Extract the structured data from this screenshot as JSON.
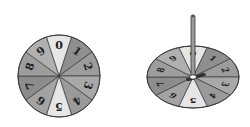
{
  "figure": {
    "left_spinner": {
      "label": "Flat spinner (top view)",
      "sections": [
        "0",
        "1",
        "2",
        "3",
        "4",
        "5",
        "6",
        "7",
        "8",
        "9"
      ],
      "shades": [
        "#e6e6e6",
        "#8f8f8f",
        "#9c9c9c",
        "#a8a8a8",
        "#9a9a9a",
        "#e6e6e6",
        "#a3a3a3",
        "#8c8c8c",
        "#9d9d9d",
        "#b0b0b0"
      ]
    },
    "right_spinner": {
      "label": "Spinner in perspective with pointer",
      "sections": [
        "0",
        "1",
        "2",
        "3",
        "4",
        "5",
        "6",
        "7",
        "8",
        "9"
      ],
      "shades": [
        "#e6e6e6",
        "#8f8f8f",
        "#9c9c9c",
        "#a8a8a8",
        "#9a9a9a",
        "#e6e6e6",
        "#a3a3a3",
        "#8c8c8c",
        "#9d9d9d",
        "#b0b0b0"
      ]
    },
    "colors": {
      "outline": "#3a3a3a",
      "digit": "#1f1f1f",
      "pointer": "#9a9a9a"
    }
  }
}
